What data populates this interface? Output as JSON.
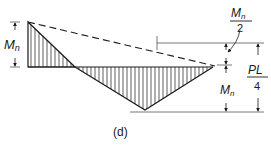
{
  "diagram": {
    "type": "moment-diagram",
    "caption": "(d)",
    "labels": {
      "left_moment": "M",
      "left_moment_sub": "n",
      "half_moment_num": "M",
      "half_moment_num_sub": "n",
      "half_moment_den": "2",
      "right_moment": "M",
      "right_moment_sub": "n",
      "pl_num": "PL",
      "pl_den": "4"
    },
    "colors": {
      "line": "#1a1a1a",
      "thin_line": "#555555",
      "background": "#ffffff"
    }
  }
}
